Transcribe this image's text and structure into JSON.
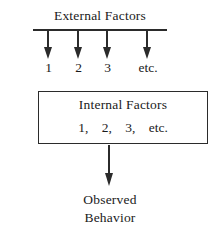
{
  "diagram": {
    "colors": {
      "ink": "#2b2b2b",
      "text": "#1a1a1a",
      "background": "#ffffff"
    },
    "external": {
      "heading": "External Factors",
      "labels": [
        "1",
        "2",
        "3",
        "etc."
      ],
      "arrow_count": 4,
      "arrow_direction": "down",
      "rule": "horizontal-line"
    },
    "internal": {
      "heading": "Internal Factors",
      "items": [
        "1,",
        "2,",
        "3,",
        "etc."
      ],
      "shape": "rectangle"
    },
    "output": {
      "arrow_direction": "down",
      "lines": [
        "Observed",
        "Behavior"
      ]
    }
  }
}
